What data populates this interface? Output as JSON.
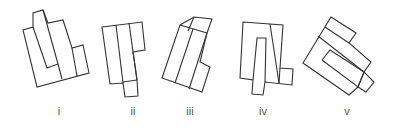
{
  "figure": {
    "type": "spatial-reasoning-puzzle",
    "stroke_color": "#333333",
    "label_color": "#555555",
    "options": [
      {
        "id": "i",
        "label": "i",
        "label_x": 59
      },
      {
        "id": "ii",
        "label": "ii",
        "label_x": 133
      },
      {
        "id": "iii",
        "label": "iii",
        "label_x": 190
      },
      {
        "id": "iv",
        "label": "iv",
        "label_x": 263
      },
      {
        "id": "v",
        "label": "v",
        "label_x": 347
      }
    ]
  }
}
